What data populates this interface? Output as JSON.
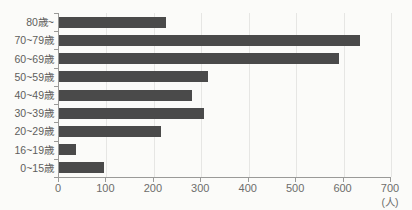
{
  "chart_data": {
    "type": "bar",
    "orientation": "horizontal",
    "title": "",
    "categories": [
      "80歳~",
      "70~79歳",
      "60~69歳",
      "50~59歳",
      "40~49歳",
      "30~39歳",
      "20~29歳",
      "16~19歳",
      "0~15歳"
    ],
    "values": [
      225,
      635,
      590,
      315,
      280,
      305,
      215,
      35,
      95
    ],
    "xlabel": "(人)",
    "ylabel": "",
    "xlim": [
      0,
      700
    ],
    "x_ticks": [
      0,
      100,
      200,
      300,
      400,
      500,
      600,
      700
    ],
    "grid": true,
    "legend": false
  },
  "colors": {
    "bar": "#4a4a4a",
    "gridline": "#e6e6e4",
    "axis": "#9a9a98",
    "category_text": "#5e5e5c",
    "tick_text": "#6d6d6b",
    "background": "#fbfbf9"
  }
}
